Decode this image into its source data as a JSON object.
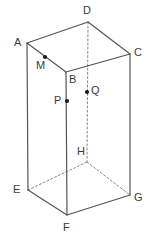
{
  "figure": {
    "type": "geometry-diagram",
    "canvas": {
      "width": 159,
      "height": 249
    },
    "colors": {
      "background": "#ffffff",
      "solid_edge": "#555555",
      "hidden_edge": "#888888",
      "point_marker": "#1a1a1a",
      "label_text": "#3a3a3a"
    },
    "style": {
      "solid_edge_width": 1.2,
      "hidden_edge_width": 1,
      "hidden_dash_pattern": "2,2.2",
      "point_radius": 2.1
    },
    "vertices": [
      {
        "name": "A",
        "x": 27,
        "y": 43,
        "label": "A",
        "label_x": 14,
        "label_y": 37,
        "hidden": false
      },
      {
        "name": "B",
        "x": 66,
        "y": 72,
        "label": "B",
        "label_x": 69,
        "label_y": 74,
        "hidden": false
      },
      {
        "name": "C",
        "x": 130,
        "y": 54,
        "label": "C",
        "label_x": 134,
        "label_y": 47,
        "hidden": false
      },
      {
        "name": "D",
        "x": 88,
        "y": 22,
        "label": "D",
        "label_x": 83,
        "label_y": 5,
        "hidden": false
      },
      {
        "name": "E",
        "x": 28,
        "y": 190,
        "label": "E",
        "label_x": 13,
        "label_y": 184,
        "hidden": false
      },
      {
        "name": "F",
        "x": 67,
        "y": 215,
        "label": "F",
        "label_x": 63,
        "label_y": 222,
        "hidden": false
      },
      {
        "name": "G",
        "x": 130,
        "y": 195,
        "label": "G",
        "label_x": 134,
        "label_y": 192,
        "hidden": false
      },
      {
        "name": "H",
        "x": 87,
        "y": 162,
        "label": "H",
        "label_x": 77,
        "label_y": 146,
        "hidden": true
      }
    ],
    "marked_points": [
      {
        "name": "M",
        "x": 45,
        "y": 57,
        "label": "M",
        "label_x": 36,
        "label_y": 60,
        "on_segment": "AB"
      },
      {
        "name": "P",
        "x": 67,
        "y": 101,
        "label": "P",
        "label_x": 54,
        "label_y": 95,
        "on_segment": "BF"
      },
      {
        "name": "Q",
        "x": 87,
        "y": 92,
        "label": "Q",
        "label_x": 91,
        "label_y": 85,
        "on_segment": "DH"
      }
    ],
    "solid_edges": [
      {
        "name": "edge-AD",
        "from": "A",
        "to": "D"
      },
      {
        "name": "edge-DC",
        "from": "D",
        "to": "C"
      },
      {
        "name": "edge-CB",
        "from": "C",
        "to": "B"
      },
      {
        "name": "edge-BA",
        "from": "B",
        "to": "A"
      },
      {
        "name": "edge-AE",
        "from": "A",
        "to": "E"
      },
      {
        "name": "edge-BF",
        "from": "B",
        "to": "F"
      },
      {
        "name": "edge-CG",
        "from": "C",
        "to": "G"
      },
      {
        "name": "edge-EF",
        "from": "E",
        "to": "F"
      },
      {
        "name": "edge-FG",
        "from": "F",
        "to": "G"
      }
    ],
    "hidden_edges": [
      {
        "name": "edge-DH",
        "from": "D",
        "to": "H"
      },
      {
        "name": "edge-EH",
        "from": "E",
        "to": "H"
      },
      {
        "name": "edge-HG",
        "from": "H",
        "to": "G"
      }
    ]
  }
}
